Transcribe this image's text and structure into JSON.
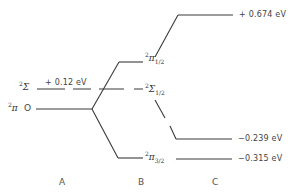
{
  "diagram": {
    "type": "energy-level-diagram",
    "columns": [
      {
        "id": "A",
        "label": "A"
      },
      {
        "id": "B",
        "label": "B"
      },
      {
        "id": "C",
        "label": "C"
      }
    ],
    "column_a": {
      "levels": [
        {
          "symbol": "Σ",
          "multiplicity": "2",
          "energy_label": "+ 0.12 eV",
          "style": "dashed"
        },
        {
          "symbol": "π",
          "multiplicity": "2",
          "energy_label": "O",
          "style": "solid"
        }
      ]
    },
    "column_b": {
      "levels": [
        {
          "symbol": "π",
          "multiplicity": "2",
          "subscript": "1/2"
        },
        {
          "symbol": "Σ",
          "multiplicity": "2",
          "subscript": "1/2"
        },
        {
          "symbol": "π",
          "multiplicity": "2",
          "subscript": "3/2"
        }
      ]
    },
    "column_c": {
      "levels": [
        {
          "energy_label": "+ 0.674 eV"
        },
        {
          "energy_label": "−0.239 eV"
        },
        {
          "energy_label": "−0.315 eV"
        }
      ]
    },
    "line_color": "#3a3a3a"
  }
}
